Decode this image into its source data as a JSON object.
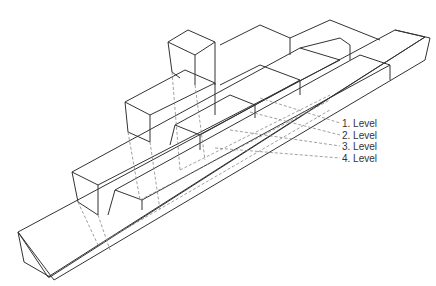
{
  "diagram": {
    "labels": [
      {
        "text": "1. Level",
        "x": 342,
        "y": 118
      },
      {
        "text": "2. Level",
        "x": 342,
        "y": 130
      },
      {
        "text": "3. Level",
        "x": 342,
        "y": 141
      },
      {
        "text": "4. Level",
        "x": 342,
        "y": 153
      }
    ],
    "leaders": [
      {
        "x1": 260,
        "y1": 98,
        "x2": 340,
        "y2": 123
      },
      {
        "x1": 250,
        "y1": 112,
        "x2": 340,
        "y2": 135
      },
      {
        "x1": 230,
        "y1": 130,
        "x2": 340,
        "y2": 146
      },
      {
        "x1": 215,
        "y1": 148,
        "x2": 340,
        "y2": 158
      }
    ],
    "colors": {
      "line": "#333333",
      "hidden": "#888888"
    }
  }
}
